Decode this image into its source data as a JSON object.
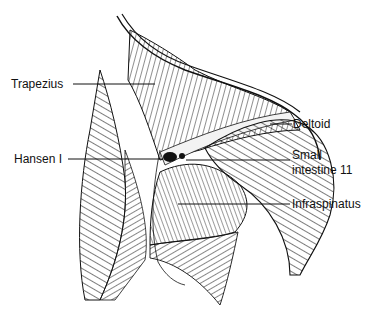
{
  "diagram": {
    "labels": {
      "trapezius": "Trapezius",
      "hansen": "Hansen I",
      "deltoid": "Deltoid",
      "small_intestine_line1": "Small",
      "small_intestine_line2": "intestine 11",
      "infraspinatus": "Infraspinatus"
    },
    "colors": {
      "ink": "#111111",
      "background": "#ffffff"
    }
  }
}
